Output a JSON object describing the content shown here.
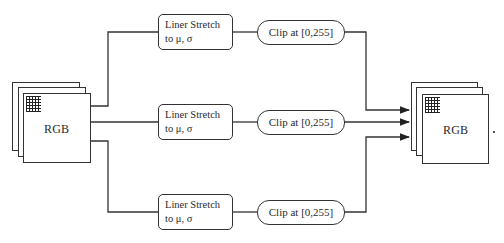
{
  "diagram": {
    "input": {
      "label": "RGB"
    },
    "output": {
      "label": "RGB"
    },
    "branches": [
      {
        "stretch": {
          "line1": "Liner Stretch",
          "line2": "to μ, σ"
        },
        "clip": {
          "label": "Clip at [0,255]"
        }
      },
      {
        "stretch": {
          "line1": "Liner Stretch",
          "line2": "to μ, σ"
        },
        "clip": {
          "label": "Clip at [0,255]"
        }
      },
      {
        "stretch": {
          "line1": "Liner Stretch",
          "line2": "to μ, σ"
        },
        "clip": {
          "label": "Clip at [0,255]"
        }
      }
    ],
    "colors": {
      "stroke": "#333333",
      "background": "#ffffff",
      "text": "#2a2a2a"
    }
  }
}
